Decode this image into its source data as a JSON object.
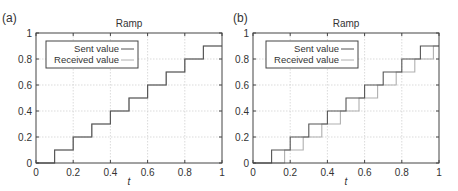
{
  "figure": {
    "panels": [
      {
        "label": "(a)",
        "title": "Ramp",
        "xlabel": "t"
      },
      {
        "label": "(b)",
        "title": "Ramp",
        "xlabel": "t"
      }
    ],
    "legend": {
      "sent": "Sent value",
      "received": "Received value"
    },
    "xticks": [
      "0",
      "0.2",
      "0.4",
      "0.6",
      "0.8",
      "1"
    ],
    "yticks": [
      "0",
      "0.2",
      "0.4",
      "0.6",
      "0.8",
      "1"
    ],
    "colors": {
      "sent": "#555555",
      "received": "#b0b0b0",
      "grid": "#cccccc",
      "axis": "#444444"
    }
  },
  "chart_data": [
    {
      "type": "line",
      "panel": "(a)",
      "title": "Ramp",
      "xlabel": "t",
      "ylabel": "",
      "xlim": [
        0,
        1
      ],
      "ylim": [
        0,
        1
      ],
      "grid": true,
      "legend_position": "upper left",
      "xticks": [
        0,
        0.2,
        0.4,
        0.6,
        0.8,
        1
      ],
      "yticks": [
        0,
        0.2,
        0.4,
        0.6,
        0.8,
        1
      ],
      "series": [
        {
          "name": "Sent value",
          "step": true,
          "x": [
            0,
            0.1,
            0.1,
            0.2,
            0.2,
            0.3,
            0.3,
            0.4,
            0.4,
            0.5,
            0.5,
            0.6,
            0.6,
            0.7,
            0.7,
            0.8,
            0.8,
            0.9,
            0.9,
            1.0
          ],
          "y": [
            0,
            0,
            0.1,
            0.1,
            0.2,
            0.2,
            0.3,
            0.3,
            0.4,
            0.4,
            0.5,
            0.5,
            0.6,
            0.6,
            0.7,
            0.7,
            0.8,
            0.8,
            0.9,
            0.9
          ]
        },
        {
          "name": "Received value",
          "step": true,
          "x": [
            0,
            0.1,
            0.1,
            0.2,
            0.2,
            0.3,
            0.3,
            0.4,
            0.4,
            0.5,
            0.5,
            0.6,
            0.6,
            0.7,
            0.7,
            0.8,
            0.8,
            0.9,
            0.9,
            1.0
          ],
          "y": [
            0,
            0,
            0.1,
            0.1,
            0.2,
            0.2,
            0.3,
            0.3,
            0.4,
            0.4,
            0.5,
            0.5,
            0.6,
            0.6,
            0.7,
            0.7,
            0.8,
            0.8,
            0.9,
            0.9
          ]
        }
      ]
    },
    {
      "type": "line",
      "panel": "(b)",
      "title": "Ramp",
      "xlabel": "t",
      "ylabel": "",
      "xlim": [
        0,
        1
      ],
      "ylim": [
        0,
        1
      ],
      "grid": true,
      "legend_position": "upper left",
      "xticks": [
        0,
        0.2,
        0.4,
        0.6,
        0.8,
        1
      ],
      "yticks": [
        0,
        0.2,
        0.4,
        0.6,
        0.8,
        1
      ],
      "series": [
        {
          "name": "Sent value",
          "step": true,
          "x": [
            0,
            0.1,
            0.1,
            0.2,
            0.2,
            0.3,
            0.3,
            0.4,
            0.4,
            0.5,
            0.5,
            0.6,
            0.6,
            0.7,
            0.7,
            0.8,
            0.8,
            0.9,
            0.9,
            1.0
          ],
          "y": [
            0,
            0,
            0.1,
            0.1,
            0.2,
            0.2,
            0.3,
            0.3,
            0.4,
            0.4,
            0.5,
            0.5,
            0.6,
            0.6,
            0.7,
            0.7,
            0.8,
            0.8,
            0.9,
            0.9
          ]
        },
        {
          "name": "Received value",
          "step": true,
          "lag": 0.07,
          "x": [
            0,
            0.17,
            0.17,
            0.27,
            0.27,
            0.37,
            0.37,
            0.47,
            0.47,
            0.57,
            0.57,
            0.67,
            0.67,
            0.77,
            0.77,
            0.87,
            0.87,
            0.97,
            0.97,
            1.0
          ],
          "y": [
            0,
            0,
            0.1,
            0.1,
            0.2,
            0.2,
            0.3,
            0.3,
            0.4,
            0.4,
            0.5,
            0.5,
            0.6,
            0.6,
            0.7,
            0.7,
            0.8,
            0.8,
            0.9,
            0.9
          ]
        }
      ]
    }
  ]
}
